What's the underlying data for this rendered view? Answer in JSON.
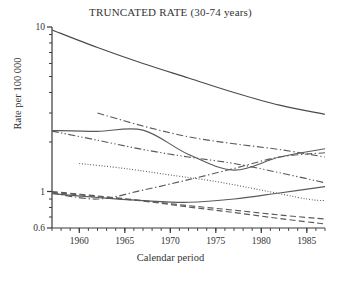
{
  "chart_data": {
    "type": "line",
    "title": "TRUNCATED RATE (30-74 years)",
    "xlabel": "Calendar period",
    "ylabel": "Rate per 100 000",
    "yscale": "log",
    "ylim": [
      0.6,
      10
    ],
    "xlim": [
      1957,
      1987
    ],
    "grid": false,
    "legend": "none",
    "ytick_labels": [
      "10",
      "1",
      "0.6"
    ],
    "ytick_values": [
      10,
      1,
      0.6
    ],
    "yminor_values": [
      9,
      8,
      7,
      6,
      5,
      4,
      3,
      2,
      0.9,
      0.8,
      0.7
    ],
    "xtick_labels": [
      "1960",
      "1965",
      "1970",
      "1975",
      "1980",
      "1985"
    ],
    "xtick_values": [
      1960,
      1965,
      1970,
      1975,
      1980,
      1985
    ],
    "xminor_step": 1,
    "series": [
      {
        "name": "series-1-solid-top",
        "style": "solid",
        "color": "#4a4a4a",
        "x": [
          1957,
          1962,
          1967,
          1972,
          1977,
          1982,
          1987
        ],
        "y": [
          9.6,
          7.5,
          6.0,
          4.9,
          4.0,
          3.35,
          2.95
        ]
      },
      {
        "name": "series-2-dashdot-upper",
        "style": "dashdot",
        "color": "#5a5a5a",
        "x": [
          1962,
          1967,
          1972,
          1977,
          1982,
          1987
        ],
        "y": [
          3.0,
          2.5,
          2.15,
          1.95,
          1.8,
          1.62
        ]
      },
      {
        "name": "series-3-solid-plateau",
        "style": "solid",
        "color": "#5a5a5a",
        "x": [
          1957,
          1962,
          1967,
          1972,
          1977,
          1982,
          1987
        ],
        "y": [
          2.35,
          2.32,
          2.36,
          1.68,
          1.35,
          1.62,
          1.82
        ]
      },
      {
        "name": "series-4-dashdotdot-mid",
        "style": "dashdotdot",
        "color": "#5a5a5a",
        "x": [
          1957,
          1962,
          1967,
          1972,
          1977,
          1982,
          1987
        ],
        "y": [
          2.33,
          2.05,
          1.8,
          1.62,
          1.48,
          1.3,
          1.13
        ]
      },
      {
        "name": "series-5-dotted",
        "style": "dotted",
        "color": "#555555",
        "x": [
          1960,
          1965,
          1970,
          1975,
          1980,
          1985,
          1987
        ],
        "y": [
          1.48,
          1.38,
          1.26,
          1.15,
          1.02,
          0.9,
          0.88
        ]
      },
      {
        "name": "series-6-dashdot-rising",
        "style": "dashdot",
        "color": "#5a5a5a",
        "x": [
          1957,
          1962,
          1967,
          1972,
          1977,
          1982,
          1987
        ],
        "y": [
          0.98,
          0.9,
          1.02,
          1.18,
          1.38,
          1.62,
          1.72
        ]
      },
      {
        "name": "series-7-solid-ushape",
        "style": "solid",
        "color": "#5a5a5a",
        "x": [
          1957,
          1962,
          1967,
          1972,
          1977,
          1982,
          1987
        ],
        "y": [
          0.97,
          0.92,
          0.88,
          0.86,
          0.9,
          0.98,
          1.07
        ]
      },
      {
        "name": "series-8-dashed-long",
        "style": "dashed",
        "color": "#5a5a5a",
        "x": [
          1957,
          1962,
          1967,
          1972,
          1977,
          1982,
          1987
        ],
        "y": [
          1.0,
          0.94,
          0.88,
          0.82,
          0.77,
          0.72,
          0.68
        ]
      },
      {
        "name": "series-9-dashed-steep",
        "style": "dashed",
        "color": "#5a5a5a",
        "x": [
          1957,
          1962,
          1967,
          1972,
          1977,
          1982,
          1987
        ],
        "y": [
          0.99,
          0.93,
          0.875,
          0.805,
          0.745,
          0.685,
          0.635
        ]
      }
    ]
  }
}
